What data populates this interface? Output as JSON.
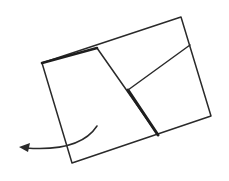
{
  "diagram": {
    "type": "paper-folding-instruction",
    "canvas": {
      "width": 229,
      "height": 181,
      "background": "#ffffff"
    },
    "colors": {
      "line": "#2a2a2a",
      "emphasis": "#1e1e1e"
    },
    "sheet": {
      "outline": [
        [
          42,
          63
        ],
        [
          181,
          17
        ],
        [
          211,
          116
        ],
        [
          72,
          163
        ]
      ],
      "stroke_width": 1.5
    },
    "creases": [
      {
        "name": "main-fold-line",
        "from": [
          97,
          48
        ],
        "to": [
          158,
          135
        ],
        "stroke_width": 1.5
      },
      {
        "name": "emphasized-fold-segment",
        "from": [
          128,
          90
        ],
        "to": [
          158,
          135
        ],
        "stroke_width": 3
      },
      {
        "name": "right-crease",
        "from": [
          128,
          90
        ],
        "to": [
          190,
          45
        ],
        "stroke_width": 1.5
      },
      {
        "name": "top-edge-emphasis",
        "from": [
          42,
          63
        ],
        "to": [
          97,
          48
        ],
        "stroke_width": 2.6
      }
    ],
    "arrow": {
      "name": "fold-direction-arrow",
      "path": "M97,126 Q80,152 26,148",
      "head": [
        [
          19,
          147
        ],
        [
          30,
          143
        ],
        [
          28,
          152
        ]
      ],
      "stroke_width": 1.5,
      "direction": "left-down"
    }
  }
}
